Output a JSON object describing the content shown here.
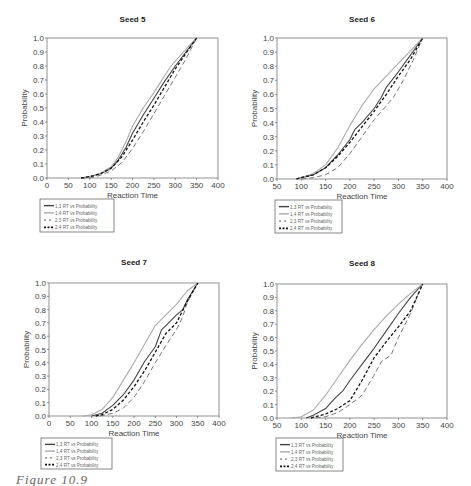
{
  "caption": "Figure 10.9",
  "legend_labels": [
    "1,3 RT vs Probability",
    "1,4 RT vs Probability",
    "2,3 RT vs Probability",
    "2,4 RT vs Probability"
  ],
  "series_styles": [
    {
      "name": "1,3 RT vs Probability",
      "color": "#444444",
      "dash": "",
      "width": 1.1
    },
    {
      "name": "1,4 RT vs Probability",
      "color": "#aaaaaa",
      "dash": "",
      "width": 1.1
    },
    {
      "name": "2,3 RT vs Probability",
      "color": "#777777",
      "dash": "5,3",
      "width": 1.0
    },
    {
      "name": "2,4 RT vs Probability",
      "color": "#111111",
      "dash": "3,2",
      "width": 1.3
    }
  ],
  "chart_data": [
    {
      "type": "line",
      "title": "Seed 5",
      "xlabel": "Reaction Time",
      "ylabel": "Probability",
      "xlim": [
        0,
        400
      ],
      "ylim": [
        0,
        1
      ],
      "xticks": [
        0,
        50,
        100,
        150,
        200,
        250,
        300,
        350,
        400
      ],
      "yticks": [
        "0.0",
        "0.1",
        "0.2",
        "0.3",
        "0.4",
        "0.5",
        "0.6",
        "0.7",
        "0.8",
        "0.9",
        "1.0"
      ],
      "grid": false,
      "legend_position": "below",
      "series": [
        {
          "name": "1,3 RT vs Probability",
          "x": [
            80,
            100,
            125,
            150,
            165,
            185,
            200,
            225,
            250,
            275,
            300,
            325,
            350
          ],
          "y": [
            0,
            0.01,
            0.03,
            0.07,
            0.12,
            0.22,
            0.32,
            0.45,
            0.57,
            0.69,
            0.8,
            0.9,
            1.0
          ]
        },
        {
          "name": "1,4 RT vs Probability",
          "x": [
            80,
            100,
            125,
            150,
            165,
            185,
            200,
            225,
            250,
            275,
            290,
            325,
            350
          ],
          "y": [
            0,
            0.01,
            0.03,
            0.08,
            0.14,
            0.26,
            0.37,
            0.5,
            0.61,
            0.73,
            0.8,
            0.92,
            1.0
          ]
        },
        {
          "name": "2,3 RT vs Probability",
          "x": [
            80,
            100,
            125,
            150,
            175,
            200,
            225,
            250,
            275,
            300,
            325,
            350
          ],
          "y": [
            0,
            0.0,
            0.02,
            0.05,
            0.11,
            0.21,
            0.33,
            0.46,
            0.59,
            0.72,
            0.85,
            1.0
          ]
        },
        {
          "name": "2,4 RT vs Probability",
          "x": [
            80,
            100,
            125,
            150,
            175,
            200,
            225,
            250,
            275,
            300,
            325,
            350
          ],
          "y": [
            0,
            0.01,
            0.03,
            0.07,
            0.15,
            0.27,
            0.4,
            0.52,
            0.65,
            0.78,
            0.89,
            1.0
          ]
        }
      ]
    },
    {
      "type": "line",
      "title": "Seed 6",
      "xlabel": "Reaction Time",
      "ylabel": "Probability",
      "xlim": [
        50,
        400
      ],
      "ylim": [
        0,
        1
      ],
      "xticks": [
        50,
        100,
        150,
        200,
        250,
        300,
        350,
        400
      ],
      "yticks": [
        "0.0",
        "0.1",
        "0.2",
        "0.3",
        "0.4",
        "0.5",
        "0.6",
        "0.7",
        "0.8",
        "0.9",
        "1.0"
      ],
      "grid": false,
      "legend_position": "below",
      "series": [
        {
          "name": "1,3 RT vs Probability",
          "x": [
            90,
            100,
            125,
            150,
            175,
            200,
            210,
            225,
            250,
            265,
            275,
            300,
            325,
            350
          ],
          "y": [
            0,
            0.01,
            0.03,
            0.08,
            0.17,
            0.28,
            0.35,
            0.4,
            0.5,
            0.58,
            0.65,
            0.76,
            0.88,
            1.0
          ]
        },
        {
          "name": "1,4 RT vs Probability",
          "x": [
            90,
            100,
            125,
            150,
            175,
            200,
            225,
            250,
            275,
            300,
            325,
            350
          ],
          "y": [
            0,
            0.01,
            0.04,
            0.1,
            0.22,
            0.38,
            0.52,
            0.64,
            0.73,
            0.82,
            0.91,
            1.0
          ]
        },
        {
          "name": "2,3 RT vs Probability",
          "x": [
            100,
            125,
            150,
            175,
            200,
            225,
            250,
            275,
            290,
            310,
            330,
            350
          ],
          "y": [
            0,
            0.01,
            0.03,
            0.08,
            0.18,
            0.3,
            0.42,
            0.52,
            0.58,
            0.7,
            0.84,
            1.0
          ]
        },
        {
          "name": "2,4 RT vs Probability",
          "x": [
            90,
            100,
            125,
            150,
            175,
            200,
            225,
            250,
            275,
            300,
            325,
            350
          ],
          "y": [
            0,
            0.01,
            0.03,
            0.08,
            0.16,
            0.26,
            0.37,
            0.48,
            0.6,
            0.73,
            0.85,
            1.0
          ]
        }
      ]
    },
    {
      "type": "line",
      "title": "Seed 7",
      "xlabel": "Reaction Time",
      "ylabel": "Probability",
      "xlim": [
        0,
        400
      ],
      "ylim": [
        0,
        1
      ],
      "xticks": [
        0,
        50,
        100,
        150,
        200,
        250,
        300,
        350,
        400
      ],
      "yticks": [
        "0.0",
        "0.1",
        "0.2",
        "0.3",
        "0.4",
        "0.5",
        "0.6",
        "0.7",
        "0.8",
        "0.9",
        "1.0"
      ],
      "grid": false,
      "legend_position": "below",
      "series": [
        {
          "name": "1,3 RT vs Probability",
          "x": [
            100,
            125,
            150,
            175,
            200,
            225,
            250,
            265,
            275,
            300,
            315,
            325,
            350
          ],
          "y": [
            0,
            0.02,
            0.08,
            0.16,
            0.27,
            0.41,
            0.52,
            0.65,
            0.68,
            0.76,
            0.8,
            0.87,
            1.0
          ]
        },
        {
          "name": "1,4 RT vs Probability",
          "x": [
            80,
            100,
            125,
            150,
            175,
            200,
            225,
            250,
            275,
            300,
            325,
            350
          ],
          "y": [
            0,
            0.01,
            0.05,
            0.14,
            0.27,
            0.4,
            0.54,
            0.68,
            0.76,
            0.84,
            0.94,
            1.0
          ]
        },
        {
          "name": "2,3 RT vs Probability",
          "x": [
            120,
            150,
            175,
            200,
            225,
            250,
            275,
            300,
            315,
            325,
            350
          ],
          "y": [
            0,
            0.02,
            0.06,
            0.14,
            0.26,
            0.4,
            0.53,
            0.65,
            0.75,
            0.85,
            1.0
          ]
        },
        {
          "name": "2,4 RT vs Probability",
          "x": [
            110,
            125,
            150,
            175,
            200,
            225,
            250,
            275,
            300,
            325,
            350
          ],
          "y": [
            0,
            0.01,
            0.05,
            0.12,
            0.22,
            0.34,
            0.48,
            0.62,
            0.7,
            0.86,
            1.0
          ]
        }
      ]
    },
    {
      "type": "line",
      "title": "Seed 8",
      "xlabel": "Reaction Time",
      "ylabel": "Probability",
      "xlim": [
        50,
        400
      ],
      "ylim": [
        0,
        1
      ],
      "xticks": [
        50,
        100,
        150,
        200,
        250,
        300,
        350,
        400
      ],
      "yticks": [
        "0.0",
        "0.1",
        "0.2",
        "0.3",
        "0.4",
        "0.5",
        "0.6",
        "0.7",
        "0.8",
        "0.9",
        "1.0"
      ],
      "grid": false,
      "legend_position": "below",
      "series": [
        {
          "name": "1,3 RT vs Probability",
          "x": [
            110,
            125,
            150,
            170,
            185,
            200,
            225,
            250,
            275,
            300,
            325,
            350
          ],
          "y": [
            0,
            0.02,
            0.07,
            0.15,
            0.2,
            0.28,
            0.4,
            0.52,
            0.65,
            0.78,
            0.9,
            1.0
          ]
        },
        {
          "name": "1,4 RT vs Probability",
          "x": [
            80,
            100,
            125,
            150,
            175,
            200,
            225,
            250,
            275,
            300,
            325,
            350
          ],
          "y": [
            0,
            0.01,
            0.06,
            0.17,
            0.3,
            0.43,
            0.55,
            0.66,
            0.76,
            0.85,
            0.93,
            1.0
          ]
        },
        {
          "name": "2,3 RT vs Probability",
          "x": [
            130,
            150,
            175,
            200,
            225,
            250,
            265,
            285,
            300,
            325,
            340,
            350
          ],
          "y": [
            0,
            0.01,
            0.04,
            0.1,
            0.17,
            0.32,
            0.42,
            0.47,
            0.6,
            0.78,
            0.92,
            1.0
          ]
        },
        {
          "name": "2,4 RT vs Probability",
          "x": [
            120,
            150,
            175,
            200,
            225,
            250,
            275,
            300,
            325,
            340,
            350
          ],
          "y": [
            0,
            0.03,
            0.07,
            0.13,
            0.28,
            0.45,
            0.57,
            0.68,
            0.8,
            0.92,
            1.0
          ]
        }
      ]
    }
  ],
  "layout": [
    {
      "plot": [
        47,
        38,
        218,
        178
      ],
      "title_y": 22,
      "legend": [
        40,
        199,
        114,
        232
      ]
    },
    {
      "plot": [
        277,
        38,
        447,
        179
      ],
      "title_y": 22,
      "legend": [
        275,
        200,
        342,
        233
      ]
    },
    {
      "plot": [
        49,
        283,
        219,
        416
      ],
      "title_y": 265,
      "legend": [
        41,
        438,
        112,
        469
      ]
    },
    {
      "plot": [
        277,
        284,
        447,
        418
      ],
      "title_y": 266,
      "legend": [
        276,
        438,
        343,
        471
      ]
    }
  ]
}
